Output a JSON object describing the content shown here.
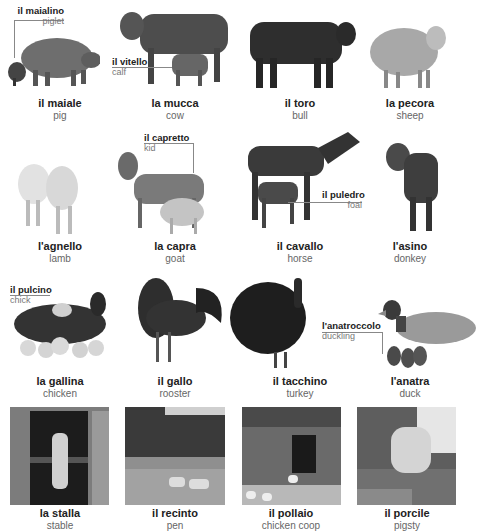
{
  "rows": [
    {
      "items": [
        {
          "it": "il maiale",
          "en": "pig",
          "sub": {
            "it": "il maialino",
            "en": "piglet"
          }
        },
        {
          "it": "la mucca",
          "en": "cow",
          "sub": {
            "it": "il vitello",
            "en": "calf"
          }
        },
        {
          "it": "il toro",
          "en": "bull"
        },
        {
          "it": "la pecora",
          "en": "sheep"
        }
      ]
    },
    {
      "items": [
        {
          "it": "l'agnello",
          "en": "lamb"
        },
        {
          "it": "la capra",
          "en": "goat",
          "sub": {
            "it": "il capretto",
            "en": "kid"
          }
        },
        {
          "it": "il cavallo",
          "en": "horse",
          "sub": {
            "it": "il puledro",
            "en": "foal"
          }
        },
        {
          "it": "l'asino",
          "en": "donkey"
        }
      ]
    },
    {
      "items": [
        {
          "it": "la gallina",
          "en": "chicken",
          "sub": {
            "it": "il pulcino",
            "en": "chick"
          }
        },
        {
          "it": "il gallo",
          "en": "rooster"
        },
        {
          "it": "il tacchino",
          "en": "turkey"
        },
        {
          "it": "l'anatra",
          "en": "duck",
          "sub": {
            "it": "l'anatroccolo",
            "en": "duckling"
          }
        }
      ]
    },
    {
      "items": [
        {
          "it": "la stalla",
          "en": "stable"
        },
        {
          "it": "il recinto",
          "en": "pen"
        },
        {
          "it": "il pollaio",
          "en": "chicken coop"
        },
        {
          "it": "il porcile",
          "en": "pigsty"
        }
      ]
    }
  ]
}
